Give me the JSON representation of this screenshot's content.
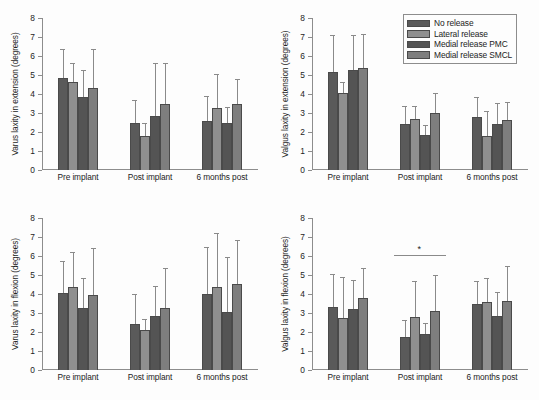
{
  "figure": {
    "panel_count": 4,
    "background_color": "#fdfdfd",
    "axis_color": "#8d8d8d"
  },
  "legend": {
    "position": "top-right of upper-right panel",
    "items": [
      {
        "label": "No release",
        "color": "#5a5a5a"
      },
      {
        "label": "Lateral release",
        "color": "#8f8f8f"
      },
      {
        "label": "Medial release PMC",
        "color": "#545454"
      },
      {
        "label": "Medial release SMCL",
        "color": "#7e7e7e"
      }
    ]
  },
  "axes": {
    "ylim": [
      0,
      8
    ],
    "yticks": [
      0,
      1,
      2,
      3,
      4,
      5,
      6,
      7,
      8
    ],
    "ytick_labels": [
      "0",
      "1",
      "2",
      "3",
      "4",
      "5",
      "6",
      "7",
      "8"
    ],
    "categories": [
      "Pre implant",
      "Post implant",
      "6 months post"
    ]
  },
  "chart_data": [
    {
      "type": "bar",
      "panel": "top-left",
      "title": "",
      "xlabel": "",
      "ylabel": "Varus laxity in extension (degrees)",
      "ylim": [
        0,
        8
      ],
      "yticks": [
        0,
        1,
        2,
        3,
        4,
        5,
        6,
        7,
        8
      ],
      "grid": false,
      "legend_position": "none",
      "categories": [
        "Pre implant",
        "Post implant",
        "6 months post"
      ],
      "series": [
        {
          "name": "No release",
          "values": [
            4.83,
            2.45,
            2.56
          ],
          "errors": [
            1.55,
            1.25,
            1.33
          ]
        },
        {
          "name": "Lateral release",
          "values": [
            4.62,
            1.78,
            3.27
          ],
          "errors": [
            1.02,
            0.72,
            1.77
          ]
        },
        {
          "name": "Medial release PMC",
          "values": [
            3.82,
            2.83,
            2.45
          ],
          "errors": [
            1.43,
            2.8,
            0.85
          ]
        },
        {
          "name": "Medial release SMCL",
          "values": [
            4.33,
            3.46,
            3.45
          ],
          "errors": [
            2.02,
            2.17,
            1.33
          ]
        }
      ],
      "annotations": []
    },
    {
      "type": "bar",
      "panel": "top-right",
      "title": "",
      "xlabel": "",
      "ylabel": "Valgus laxity in extension (degrees)",
      "ylim": [
        0,
        8
      ],
      "yticks": [
        0,
        1,
        2,
        3,
        4,
        5,
        6,
        7,
        8
      ],
      "grid": false,
      "legend_position": "upper-right",
      "categories": [
        "Pre implant",
        "Post implant",
        "6 months post"
      ],
      "series": [
        {
          "name": "No release",
          "values": [
            5.18,
            2.44,
            2.78
          ],
          "errors": [
            1.95,
            0.92,
            1.08
          ]
        },
        {
          "name": "Lateral release",
          "values": [
            4.04,
            2.66,
            1.78
          ],
          "errors": [
            0.6,
            0.72,
            1.35
          ]
        },
        {
          "name": "Medial release PMC",
          "values": [
            5.26,
            1.86,
            2.42
          ],
          "errors": [
            1.83,
            0.5,
            1.12
          ]
        },
        {
          "name": "Medial release SMCL",
          "values": [
            5.37,
            3.0,
            2.64
          ],
          "errors": [
            1.77,
            1.05,
            0.96
          ]
        }
      ],
      "annotations": []
    },
    {
      "type": "bar",
      "panel": "bottom-left",
      "title": "",
      "xlabel": "",
      "ylabel": "Varus laxity in flexion (degrees)",
      "ylim": [
        0,
        8
      ],
      "yticks": [
        0,
        1,
        2,
        3,
        4,
        5,
        6,
        7,
        8
      ],
      "grid": false,
      "legend_position": "none",
      "categories": [
        "Pre implant",
        "Post implant",
        "6 months post"
      ],
      "series": [
        {
          "name": "No release",
          "values": [
            4.05,
            2.44,
            4.02
          ],
          "errors": [
            1.68,
            1.55,
            2.43
          ]
        },
        {
          "name": "Lateral release",
          "values": [
            4.38,
            2.13,
            4.38
          ],
          "errors": [
            1.85,
            0.55,
            2.82
          ]
        },
        {
          "name": "Medial release PMC",
          "values": [
            3.24,
            2.82,
            3.07
          ],
          "errors": [
            1.6,
            1.6,
            2.88
          ]
        },
        {
          "name": "Medial release SMCL",
          "values": [
            3.97,
            3.26,
            4.53
          ],
          "errors": [
            2.47,
            2.13,
            2.32
          ]
        }
      ],
      "annotations": []
    },
    {
      "type": "bar",
      "panel": "bottom-right",
      "title": "",
      "xlabel": "",
      "ylabel": "Valgus laxity in flexion (degrees)",
      "ylim": [
        0,
        8
      ],
      "yticks": [
        0,
        1,
        2,
        3,
        4,
        5,
        6,
        7,
        8
      ],
      "grid": false,
      "legend_position": "none",
      "categories": [
        "Pre implant",
        "Post implant",
        "6 months post"
      ],
      "series": [
        {
          "name": "No release",
          "values": [
            3.32,
            1.73,
            3.45
          ],
          "errors": [
            1.74,
            0.88,
            1.25
          ]
        },
        {
          "name": "Lateral release",
          "values": [
            2.73,
            2.78,
            3.58
          ],
          "errors": [
            2.18,
            1.92,
            1.28
          ]
        },
        {
          "name": "Medial release PMC",
          "values": [
            3.21,
            1.87,
            2.85
          ],
          "errors": [
            1.54,
            0.62,
            1.26
          ]
        },
        {
          "name": "Medial release SMCL",
          "values": [
            3.77,
            3.08,
            3.63
          ],
          "errors": [
            1.62,
            1.92,
            1.82
          ]
        }
      ],
      "annotations": [
        {
          "type": "significance",
          "symbol": "*",
          "over_category": "Post implant"
        }
      ]
    }
  ]
}
